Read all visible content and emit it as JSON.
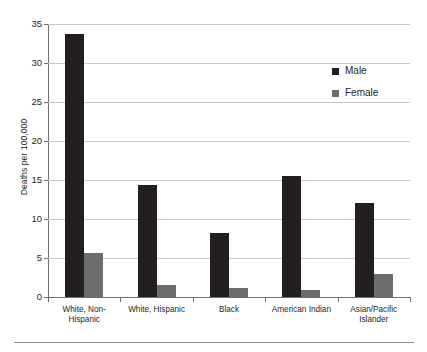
{
  "chart_data": {
    "type": "bar",
    "title": "",
    "xlabel": "",
    "ylabel": "Deaths per 100,000",
    "ylim": [
      0,
      35
    ],
    "yticks": [
      0,
      5,
      10,
      15,
      20,
      25,
      30,
      35
    ],
    "ytick_labels": [
      "0",
      "5",
      "10",
      "15",
      "20",
      "25",
      "30",
      "35"
    ],
    "grid": true,
    "legend_position": "upper right",
    "categories": [
      "White, Non-Hispanic",
      "White, Hispanic",
      "Black",
      "American Indian",
      "Asian/Pacific Islander"
    ],
    "category_lines": [
      [
        "White, Non-",
        "Hispanic"
      ],
      [
        "White, Hispanic"
      ],
      [
        "Black"
      ],
      [
        "American Indian"
      ],
      [
        "Asian/Pacific",
        "Islander"
      ]
    ],
    "series": [
      {
        "name": "Male",
        "color": "#231f20",
        "values": [
          33.7,
          14.4,
          8.2,
          15.5,
          12.1
        ]
      },
      {
        "name": "Female",
        "color": "#6d6d6d",
        "values": [
          5.6,
          1.5,
          1.2,
          0.9,
          3.0
        ]
      }
    ]
  },
  "colors": {
    "male": "#231f20",
    "female": "#6d6d6d",
    "gridline": "#c9c9c9",
    "axis": "#6f6f6f",
    "text": "#231f20",
    "background": "#ffffff"
  }
}
